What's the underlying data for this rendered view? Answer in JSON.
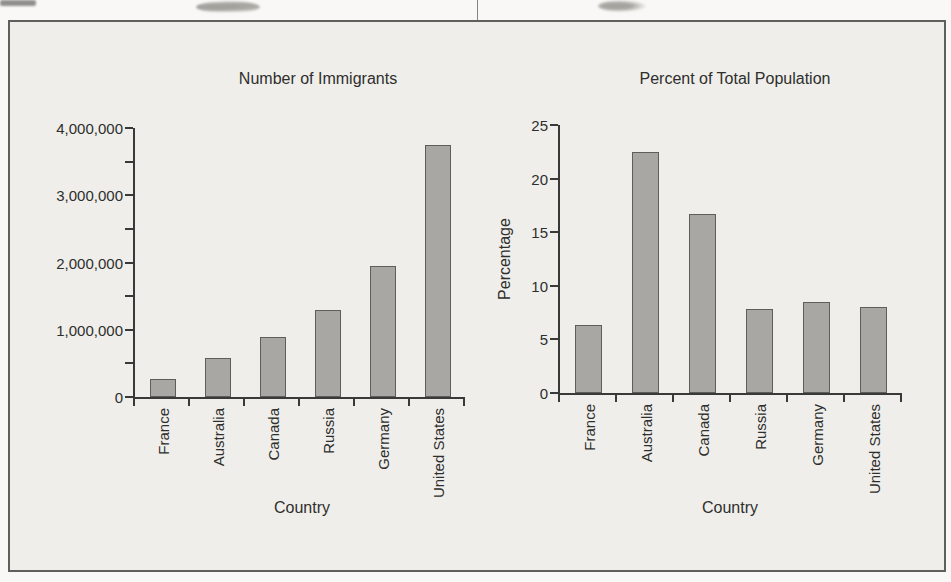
{
  "page": {
    "background": "#f9f8f6",
    "figure_background": "#efeeeb",
    "figure_border_color": "#5f5f5c",
    "axis_color": "#393937",
    "text_color": "#2e2e2c"
  },
  "chart_data": [
    {
      "type": "bar",
      "title": "Number of Immigrants",
      "xlabel": "Country",
      "ylabel": "",
      "categories": [
        "France",
        "Australia",
        "Canada",
        "Russia",
        "Germany",
        "United States"
      ],
      "values": [
        270000,
        580000,
        890000,
        1300000,
        1950000,
        3750000
      ],
      "ylim": [
        0,
        4000000
      ],
      "ytick_values": [
        0,
        1000000,
        2000000,
        3000000,
        4000000
      ],
      "ytick_labels": [
        "0",
        "1,000,000",
        "2,000,000",
        "3,000,000",
        "4,000,000"
      ],
      "minor_tick_step": 500000,
      "grid": false,
      "legend": "none",
      "bar_fill": "#a8a7a4",
      "bar_stroke": "#5d5d5a"
    },
    {
      "type": "bar",
      "title": "Percent of Total Population",
      "xlabel": "Country",
      "ylabel": "Percentage",
      "categories": [
        "France",
        "Australia",
        "Canada",
        "Russia",
        "Germany",
        "United States"
      ],
      "values": [
        6.3,
        22.5,
        16.7,
        7.8,
        8.5,
        8.0
      ],
      "ylim": [
        0,
        25
      ],
      "ytick_values": [
        0,
        5,
        10,
        15,
        20,
        25
      ],
      "ytick_labels": [
        "0",
        "5",
        "10",
        "15",
        "20",
        "25"
      ],
      "minor_tick_step": null,
      "grid": false,
      "legend": "none",
      "bar_fill": "#a8a7a4",
      "bar_stroke": "#5d5d5a"
    }
  ]
}
